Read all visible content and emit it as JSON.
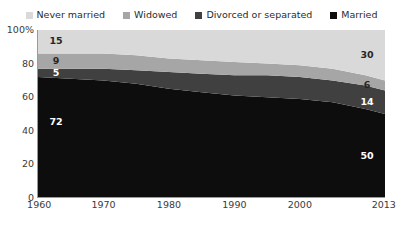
{
  "legend": {
    "position": "top-center",
    "items": [
      {
        "label": "Never married",
        "color": "#d9d9d9",
        "icon": "square-swatch-icon"
      },
      {
        "label": "Widowed",
        "color": "#a6a6a6",
        "icon": "square-swatch-icon"
      },
      {
        "label": "Divorced or separated",
        "color": "#404040",
        "icon": "square-swatch-icon"
      },
      {
        "label": "Married",
        "color": "#0d0d0d",
        "icon": "square-swatch-icon"
      }
    ]
  },
  "axes": {
    "y_ticks": [
      "100%",
      "80",
      "60",
      "40",
      "20",
      "0"
    ],
    "y_tick_values": [
      100,
      80,
      60,
      40,
      20,
      0
    ],
    "x_ticks": [
      "1960",
      "1970",
      "1980",
      "1990",
      "2000",
      "2013"
    ],
    "x_tick_values": [
      1960,
      1970,
      1980,
      1990,
      2000,
      2013
    ]
  },
  "band_labels": {
    "start": [
      {
        "text": "15",
        "series": "Never married",
        "tone": "dark"
      },
      {
        "text": "9",
        "series": "Widowed",
        "tone": "dark"
      },
      {
        "text": "5",
        "series": "Divorced or separated",
        "tone": "light"
      },
      {
        "text": "72",
        "series": "Married",
        "tone": "light"
      }
    ],
    "end": [
      {
        "text": "30",
        "series": "Never married",
        "tone": "dark"
      },
      {
        "text": "6",
        "series": "Widowed",
        "tone": "dark"
      },
      {
        "text": "14",
        "series": "Divorced or separated",
        "tone": "light"
      },
      {
        "text": "50",
        "series": "Married",
        "tone": "light"
      }
    ]
  },
  "chart_data": {
    "type": "area",
    "stacked": true,
    "stack_order_bottom_to_top": [
      "Married",
      "Divorced or separated",
      "Widowed",
      "Never married"
    ],
    "title": "",
    "subtitle": "",
    "xlabel": "",
    "ylabel": "",
    "xlim": [
      1960,
      2013
    ],
    "ylim": [
      0,
      100
    ],
    "grid": false,
    "legend_position": "top-center",
    "x": [
      1960,
      1965,
      1970,
      1975,
      1980,
      1985,
      1990,
      1995,
      2000,
      2005,
      2010,
      2013
    ],
    "series": [
      {
        "name": "Married",
        "color": "#0d0d0d",
        "values": [
          72,
          71,
          70,
          68,
          65,
          63,
          61,
          60,
          59,
          57,
          53,
          50
        ],
        "endpoint_labels": {
          "first": 72,
          "last": 50
        }
      },
      {
        "name": "Divorced or separated",
        "color": "#404040",
        "values": [
          5,
          6,
          7,
          8,
          10,
          11,
          12,
          13,
          13,
          13,
          14,
          14
        ],
        "endpoint_labels": {
          "first": 5,
          "last": 14
        }
      },
      {
        "name": "Widowed",
        "color": "#a6a6a6",
        "values": [
          9,
          9,
          9,
          9,
          8,
          8,
          8,
          7,
          7,
          7,
          6,
          6
        ],
        "endpoint_labels": {
          "first": 9,
          "last": 6
        }
      },
      {
        "name": "Never married",
        "color": "#d9d9d9",
        "values": [
          15,
          15,
          15,
          16,
          18,
          19,
          20,
          21,
          22,
          24,
          27,
          30
        ],
        "endpoint_labels": {
          "first": 15,
          "last": 30
        }
      }
    ]
  }
}
